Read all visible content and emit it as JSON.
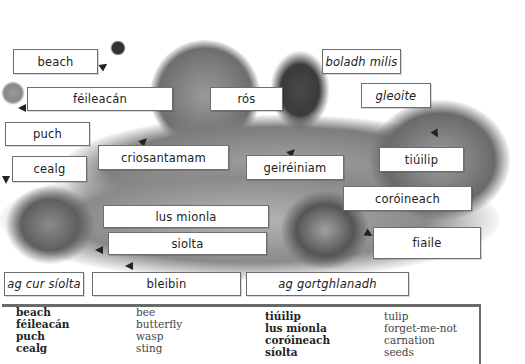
{
  "labels": {
    "beach": "beach",
    "feileacan": "féileacán",
    "ros": "rós",
    "boladh_milis": "boladh milis",
    "gleoite": "gleoite",
    "puch": "puch",
    "cealg": "cealg",
    "criosantamam": "criosantamam",
    "geireiniam": "geiréiniam",
    "tiuilip": "tiúilip",
    "coroineach": "coróineach",
    "lus_mionla": "lus mionla",
    "siolta": "siolta",
    "fiaile": "fiaile",
    "ag_cur_siolta": "ag cur síolta",
    "bleibin": "bleibin",
    "ag_gortghlanadh": "ag gortghlanadh"
  },
  "glossary": {
    "col1_irish": [
      "beach",
      "féileacán",
      "puch",
      "cealg"
    ],
    "col1_english": [
      "bee",
      "butterfly",
      "wasp",
      "sting"
    ],
    "col2_irish": [
      "tiúilip",
      "lus míonla",
      "coróineach",
      "síolta"
    ],
    "col2_english": [
      "tulip",
      "forget-me-not",
      "carnation",
      "seeds"
    ]
  },
  "illustration": {
    "description": "Garden scene with bee, butterflies, rose bush, woman smelling flower, tulips, children planting seeds and weeding",
    "colors": {
      "foliage_dark": "#5a5a5a",
      "foliage_mid": "#8c8c8c",
      "foliage_light": "#b8b8b8",
      "ground": "#a0a0a0"
    }
  }
}
